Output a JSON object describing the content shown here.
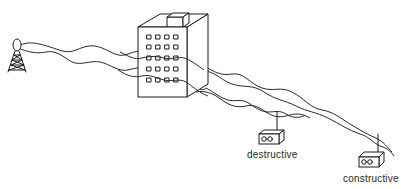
{
  "diagram": {
    "elements": {
      "transmitter": {
        "icon": "radio-tower-icon"
      },
      "building": {
        "icon": "office-building-icon",
        "window_rows": 5,
        "window_cols": 4
      },
      "receivers": [
        {
          "id": "destructive",
          "label": "destructive",
          "icon": "radio-receiver-icon"
        },
        {
          "id": "constructive",
          "label": "constructive",
          "icon": "radio-receiver-icon"
        }
      ]
    },
    "colors": {
      "line": "#1a1a1a",
      "background": "#ffffff"
    }
  }
}
